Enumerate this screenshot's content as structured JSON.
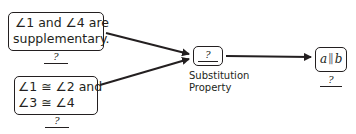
{
  "statements": [
    {
      "line1": "∠1 and ∠4 are",
      "line2": "supplementary.",
      "reason": "?"
    },
    {
      "line1": "∠1 ≅ ∠2 and",
      "line2": "∠3 ≅ ∠4",
      "reason": "?"
    }
  ],
  "middle": {
    "box_value": "?",
    "label_line1": "Substitution",
    "label_line2": "Property"
  },
  "conclusion": {
    "var_a": "a",
    "parallel_symbol": "∥",
    "var_b": "b",
    "reason": "?"
  }
}
